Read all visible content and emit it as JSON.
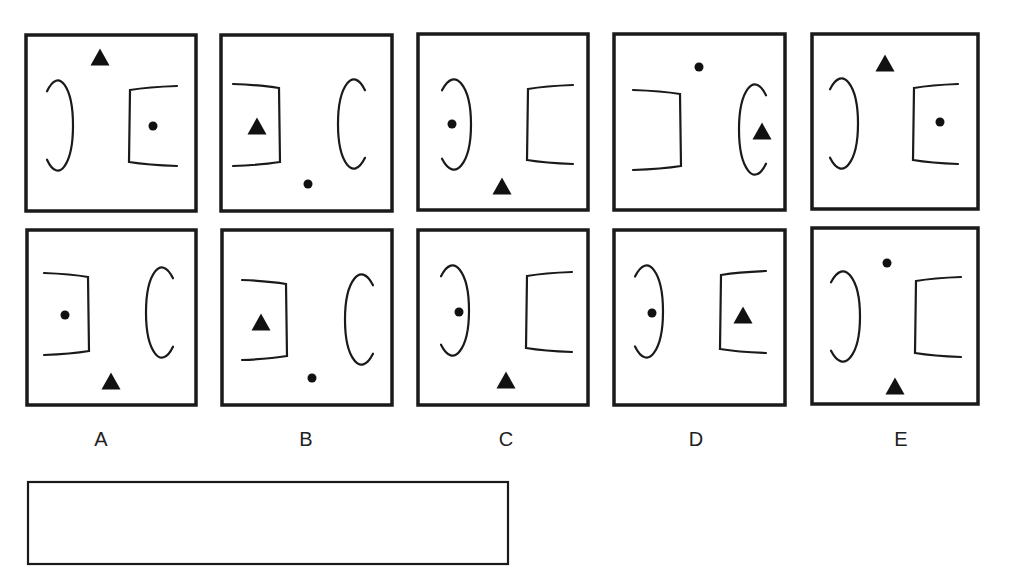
{
  "puzzle": {
    "sequence_panels": [
      {
        "id": "seq-1",
        "box": [
          26,
          35,
          170,
          176
        ],
        "shapes": [
          {
            "type": "triangle",
            "cx": 100,
            "cy": 57
          },
          {
            "type": "arc-close",
            "x": 47,
            "y": 78,
            "w": 26,
            "h": 95
          },
          {
            "type": "bracket-open",
            "x": 129,
            "y": 86,
            "w": 48,
            "h": 80
          },
          {
            "type": "dot",
            "cx": 153,
            "cy": 126
          }
        ]
      },
      {
        "id": "seq-2",
        "box": [
          221,
          35,
          171,
          176
        ],
        "shapes": [
          {
            "type": "bracket-close",
            "x": 233,
            "y": 84,
            "w": 47,
            "h": 82
          },
          {
            "type": "triangle",
            "cx": 257,
            "cy": 126
          },
          {
            "type": "arc-open",
            "x": 338,
            "y": 77,
            "w": 27,
            "h": 94
          },
          {
            "type": "dot",
            "cx": 308,
            "cy": 184
          }
        ]
      },
      {
        "id": "seq-3",
        "box": [
          418,
          34,
          170,
          176
        ],
        "shapes": [
          {
            "type": "arc-close",
            "x": 442,
            "y": 77,
            "w": 29,
            "h": 95
          },
          {
            "type": "dot",
            "cx": 452,
            "cy": 124
          },
          {
            "type": "bracket-open",
            "x": 527,
            "y": 85,
            "w": 46,
            "h": 79
          },
          {
            "type": "triangle",
            "cx": 502,
            "cy": 186
          }
        ]
      },
      {
        "id": "seq-4",
        "box": [
          614,
          34,
          171,
          176
        ],
        "shapes": [
          {
            "type": "bracket-close",
            "x": 633,
            "y": 90,
            "w": 48,
            "h": 80
          },
          {
            "type": "dot",
            "cx": 699,
            "cy": 67
          },
          {
            "type": "arc-open",
            "x": 739,
            "y": 82,
            "w": 27,
            "h": 95
          },
          {
            "type": "triangle",
            "cx": 762,
            "cy": 131
          }
        ]
      },
      {
        "id": "seq-5",
        "box": [
          812,
          34,
          166,
          175
        ],
        "shapes": [
          {
            "type": "triangle",
            "cx": 885,
            "cy": 63
          },
          {
            "type": "arc-close",
            "x": 830,
            "y": 76,
            "w": 28,
            "h": 95
          },
          {
            "type": "bracket-open",
            "x": 913,
            "y": 84,
            "w": 45,
            "h": 80
          },
          {
            "type": "dot",
            "cx": 940,
            "cy": 122
          }
        ]
      }
    ],
    "options": [
      {
        "label": "A",
        "label_x": 101,
        "box": [
          27,
          230,
          169,
          175
        ],
        "shapes": [
          {
            "type": "bracket-close",
            "x": 44,
            "y": 273,
            "w": 45,
            "h": 82
          },
          {
            "type": "dot",
            "cx": 65,
            "cy": 315
          },
          {
            "type": "arc-open",
            "x": 146,
            "y": 265,
            "w": 27,
            "h": 95
          },
          {
            "type": "triangle",
            "cx": 111,
            "cy": 381
          }
        ]
      },
      {
        "label": "B",
        "label_x": 306,
        "box": [
          222,
          230,
          170,
          175
        ],
        "shapes": [
          {
            "type": "bracket-close",
            "x": 242,
            "y": 280,
            "w": 45,
            "h": 80
          },
          {
            "type": "triangle",
            "cx": 261,
            "cy": 322
          },
          {
            "type": "arc-open",
            "x": 345,
            "y": 272,
            "w": 28,
            "h": 95
          },
          {
            "type": "dot",
            "cx": 312,
            "cy": 378
          }
        ]
      },
      {
        "label": "C",
        "label_x": 506,
        "box": [
          418,
          230,
          170,
          175
        ],
        "shapes": [
          {
            "type": "arc-close",
            "x": 441,
            "y": 263,
            "w": 28,
            "h": 95
          },
          {
            "type": "dot",
            "cx": 459,
            "cy": 312
          },
          {
            "type": "bracket-open",
            "x": 526,
            "y": 272,
            "w": 46,
            "h": 80
          },
          {
            "type": "triangle",
            "cx": 506,
            "cy": 380
          }
        ]
      },
      {
        "label": "D",
        "label_x": 696,
        "box": [
          614,
          230,
          171,
          175
        ],
        "shapes": [
          {
            "type": "arc-close",
            "x": 635,
            "y": 263,
            "w": 28,
            "h": 97
          },
          {
            "type": "dot",
            "cx": 652,
            "cy": 313
          },
          {
            "type": "bracket-open",
            "x": 720,
            "y": 271,
            "w": 46,
            "h": 82
          },
          {
            "type": "triangle",
            "cx": 743,
            "cy": 315
          }
        ]
      },
      {
        "label": "E",
        "label_x": 901,
        "box": [
          812,
          228,
          166,
          176
        ],
        "shapes": [
          {
            "type": "dot",
            "cx": 887,
            "cy": 263
          },
          {
            "type": "arc-close",
            "x": 831,
            "y": 269,
            "w": 29,
            "h": 95
          },
          {
            "type": "bracket-open",
            "x": 915,
            "y": 277,
            "w": 46,
            "h": 80
          },
          {
            "type": "triangle",
            "cx": 895,
            "cy": 386
          }
        ]
      }
    ],
    "label_y": 446,
    "answer_box": {
      "x": 28,
      "y": 482,
      "w": 480,
      "h": 82,
      "value": ""
    },
    "colors": {
      "stroke": "#1a1a1a",
      "fill": "#111111",
      "background": "#ffffff"
    }
  }
}
